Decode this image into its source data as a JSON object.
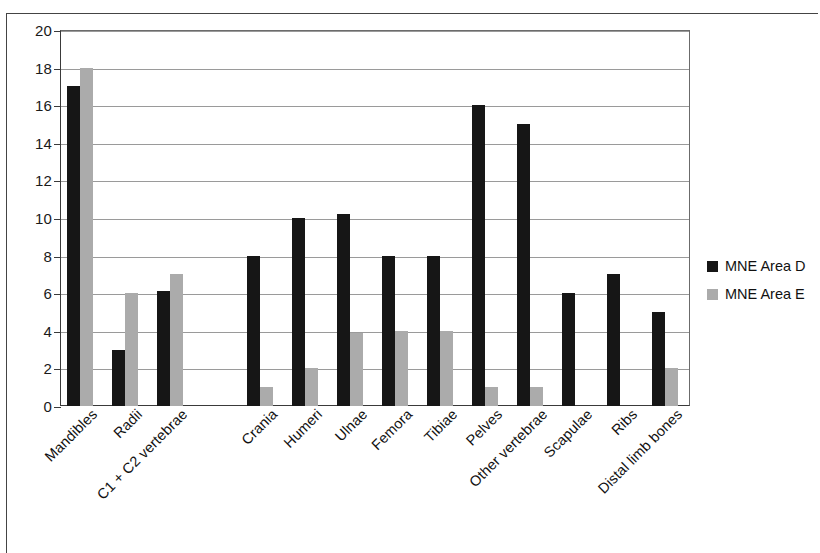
{
  "chart_data": {
    "type": "bar",
    "title": "",
    "subtitle": "",
    "xlabel": "",
    "ylabel": "",
    "ylim": [
      0,
      20
    ],
    "ytick_step": 2,
    "yticks": [
      "0",
      "2",
      "4",
      "6",
      "8",
      "10",
      "12",
      "14",
      "16",
      "18",
      "20"
    ],
    "grid": true,
    "legend_position": "right",
    "categories": [
      "Mandibles",
      "Radii",
      "C1 + C2 vertebrae",
      "",
      "Crania",
      "Humeri",
      "Ulnae",
      "Femora",
      "Tibiae",
      "Pelves",
      "Other vertebrae",
      "Scapulae",
      "Ribs",
      "Distal limb bones"
    ],
    "series": [
      {
        "name": "MNE Area D",
        "color": "#161616",
        "values": [
          17,
          3,
          6.1,
          null,
          8,
          10,
          10.2,
          8,
          8,
          16,
          15,
          6,
          7,
          5
        ]
      },
      {
        "name": "MNE Area E",
        "color": "#ababab",
        "values": [
          18,
          6,
          7,
          null,
          1,
          2,
          3.9,
          4,
          4,
          1,
          1,
          null,
          null,
          2
        ]
      }
    ]
  },
  "legend": {
    "items": [
      {
        "label": "MNE Area D",
        "swatch": "legend-swatch-black"
      },
      {
        "label": "MNE Area E",
        "swatch": "legend-swatch-gray"
      }
    ]
  }
}
